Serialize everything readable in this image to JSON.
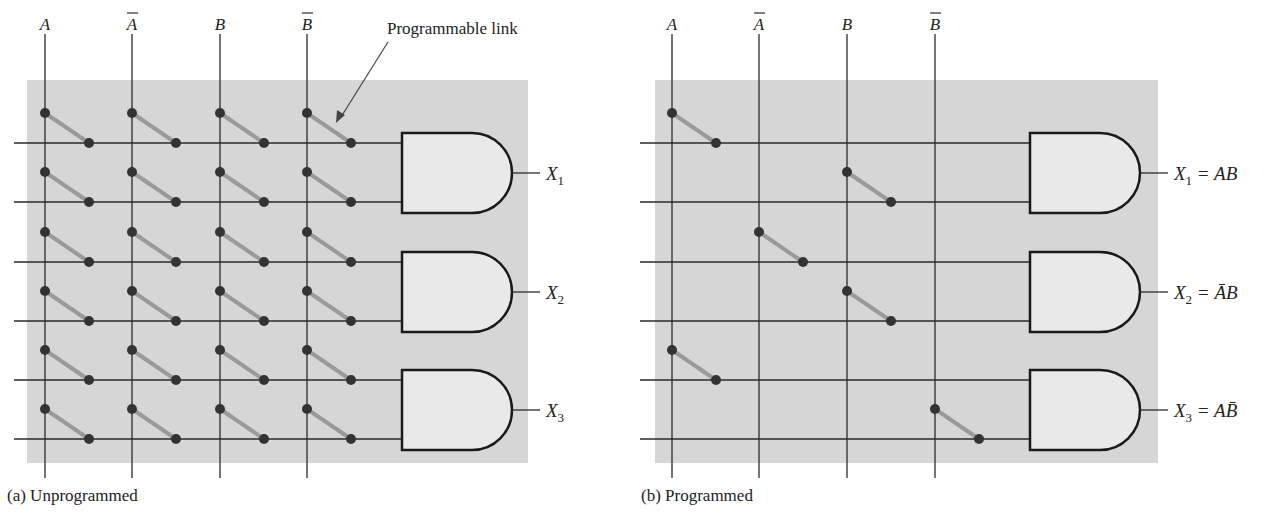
{
  "annotation": {
    "label": "Programmable link"
  },
  "panels": [
    {
      "id": "a",
      "caption": "(a) Unprogrammed",
      "inputs": [
        "A",
        "Ā",
        "B",
        "B̄"
      ],
      "input_bars": [
        false,
        true,
        false,
        true
      ],
      "input_letters": [
        "A",
        "A",
        "B",
        "B"
      ],
      "outputs": [
        {
          "name": "X",
          "sub": "1",
          "expr": ""
        },
        {
          "name": "X",
          "sub": "2",
          "expr": ""
        },
        {
          "name": "X",
          "sub": "3",
          "expr": ""
        }
      ],
      "links": [
        [
          1,
          1,
          1,
          1
        ],
        [
          1,
          1,
          1,
          1
        ],
        [
          1,
          1,
          1,
          1
        ],
        [
          1,
          1,
          1,
          1
        ],
        [
          1,
          1,
          1,
          1
        ],
        [
          1,
          1,
          1,
          1
        ]
      ]
    },
    {
      "id": "b",
      "caption": "(b) Programmed",
      "inputs": [
        "A",
        "Ā",
        "B",
        "B̄"
      ],
      "input_bars": [
        false,
        true,
        false,
        true
      ],
      "input_letters": [
        "A",
        "A",
        "B",
        "B"
      ],
      "outputs": [
        {
          "name": "X",
          "sub": "1",
          "expr": "= AB"
        },
        {
          "name": "X",
          "sub": "2",
          "expr": "= ĀB"
        },
        {
          "name": "X",
          "sub": "3",
          "expr": "= AB̄"
        }
      ],
      "links": [
        [
          1,
          0,
          0,
          0
        ],
        [
          0,
          0,
          1,
          0
        ],
        [
          0,
          1,
          0,
          0
        ],
        [
          0,
          0,
          1,
          0
        ],
        [
          1,
          0,
          0,
          0
        ],
        [
          0,
          0,
          0,
          1
        ]
      ]
    }
  ],
  "colors": {
    "panel_bg": "#d6d6d6",
    "gate_fill": "#e9e9e9",
    "line": "#2a2a2a",
    "link": "#9a9a9a",
    "dot": "#333333"
  }
}
